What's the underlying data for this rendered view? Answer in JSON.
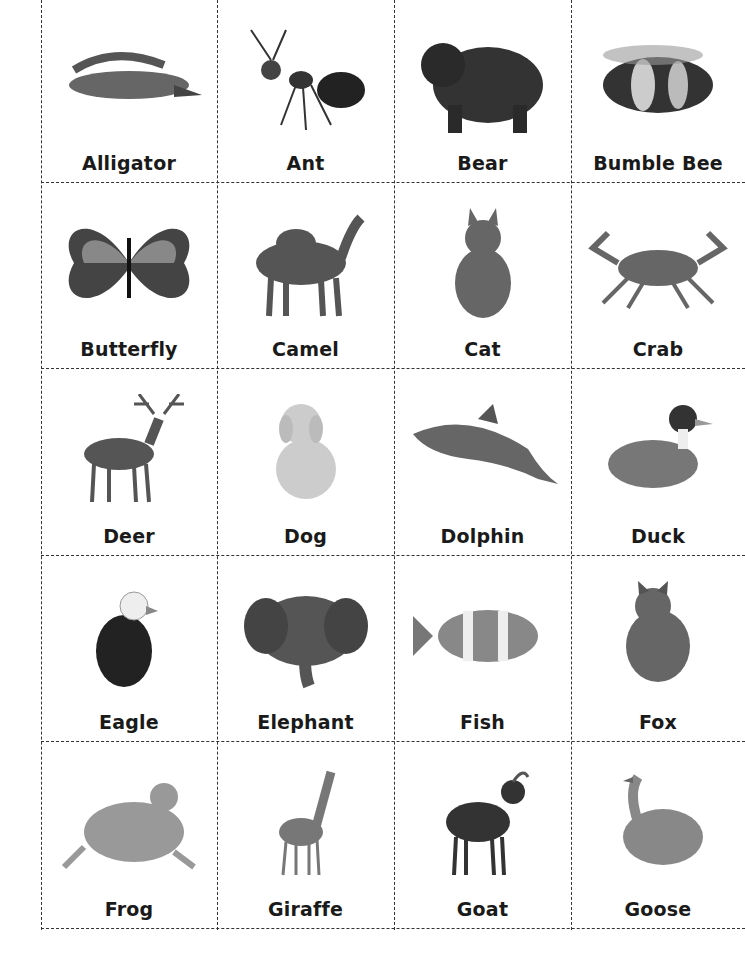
{
  "sheet": {
    "title": "Animal picture cards",
    "columns": 4,
    "rows": 5,
    "border_style": "dashed",
    "border_color": "#333333",
    "cards": [
      {
        "label": "Alligator",
        "icon": "alligator-image"
      },
      {
        "label": "Ant",
        "icon": "ant-image"
      },
      {
        "label": "Bear",
        "icon": "bear-image"
      },
      {
        "label": "Bumble Bee",
        "icon": "bumble-bee-image"
      },
      {
        "label": "Butterfly",
        "icon": "butterfly-image"
      },
      {
        "label": "Camel",
        "icon": "camel-image"
      },
      {
        "label": "Cat",
        "icon": "cat-image"
      },
      {
        "label": "Crab",
        "icon": "crab-image"
      },
      {
        "label": "Deer",
        "icon": "deer-image"
      },
      {
        "label": "Dog",
        "icon": "dog-image"
      },
      {
        "label": "Dolphin",
        "icon": "dolphin-image"
      },
      {
        "label": "Duck",
        "icon": "duck-image"
      },
      {
        "label": "Eagle",
        "icon": "eagle-image"
      },
      {
        "label": "Elephant",
        "icon": "elephant-image"
      },
      {
        "label": "Fish",
        "icon": "fish-image"
      },
      {
        "label": "Fox",
        "icon": "fox-image"
      },
      {
        "label": "Frog",
        "icon": "frog-image"
      },
      {
        "label": "Giraffe",
        "icon": "giraffe-image"
      },
      {
        "label": "Goat",
        "icon": "goat-image"
      },
      {
        "label": "Goose",
        "icon": "goose-image"
      }
    ]
  }
}
